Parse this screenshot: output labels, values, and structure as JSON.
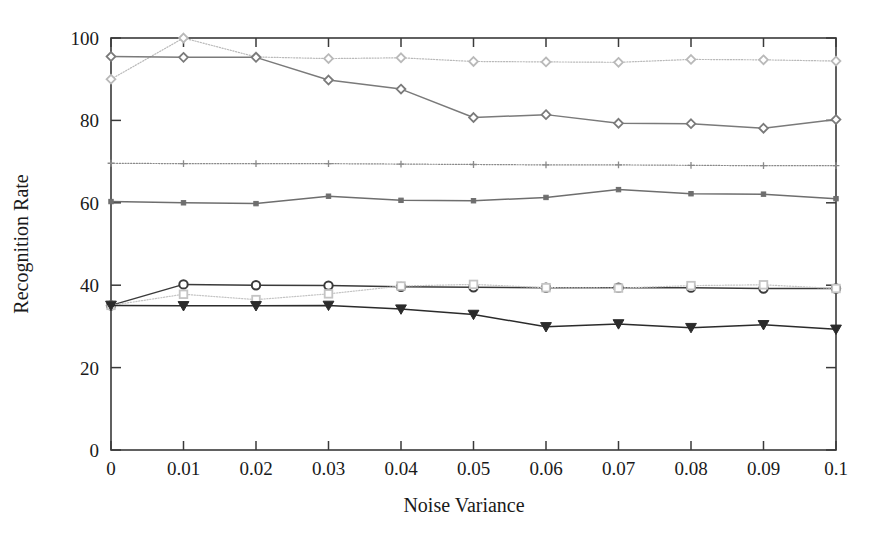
{
  "chart_data": {
    "type": "line",
    "title": "",
    "xlabel": "Noise Variance",
    "ylabel": "Recognition Rate",
    "x": [
      0,
      0.01,
      0.02,
      0.03,
      0.04,
      0.05,
      0.06,
      0.07,
      0.08,
      0.09,
      0.1
    ],
    "xticklabels": [
      "0",
      "0.01",
      "0.02",
      "0.03",
      "0.04",
      "0.05",
      "0.06",
      "0.07",
      "0.08",
      "0.09",
      "0.1"
    ],
    "yticklabels": [
      "0",
      "20",
      "40",
      "60",
      "80",
      "100"
    ],
    "yticks": [
      0,
      20,
      40,
      60,
      80,
      100
    ],
    "xlim": [
      0,
      0.1
    ],
    "ylim": [
      0,
      100
    ],
    "grid": false,
    "legend": "none",
    "series": [
      {
        "name": "series-1-light-top",
        "marker": "diamond",
        "linestyle": "dotted",
        "color": "#b9b9b9",
        "values": [
          90.0,
          100.0,
          95.4,
          95.0,
          95.2,
          94.3,
          94.2,
          94.1,
          94.8,
          94.7,
          94.4
        ]
      },
      {
        "name": "series-2-dark-declining",
        "marker": "diamond",
        "linestyle": "solid",
        "color": "#7a7a7a",
        "values": [
          95.5,
          95.3,
          95.3,
          89.8,
          87.6,
          80.7,
          81.4,
          79.3,
          79.2,
          78.1,
          80.2
        ]
      },
      {
        "name": "series-3-flat-69",
        "marker": "plus",
        "linestyle": "dotted",
        "color": "#8a8a8a",
        "values": [
          69.6,
          69.5,
          69.5,
          69.5,
          69.4,
          69.3,
          69.2,
          69.2,
          69.1,
          69.0,
          69.0
        ]
      },
      {
        "name": "series-4-mid-60",
        "marker": "square-small",
        "linestyle": "solid",
        "color": "#6e6e6e",
        "values": [
          60.3,
          60.0,
          59.8,
          61.6,
          60.6,
          60.5,
          61.3,
          63.2,
          62.2,
          62.1,
          61.0
        ]
      },
      {
        "name": "series-5-circle-40",
        "marker": "circle",
        "linestyle": "solid",
        "color": "#3a3a3a",
        "values": [
          35.1,
          40.2,
          40.0,
          39.9,
          39.6,
          39.5,
          39.4,
          39.4,
          39.4,
          39.2,
          39.2
        ]
      },
      {
        "name": "series-6-light-square",
        "marker": "square-open",
        "linestyle": "dotted",
        "color": "#c4c4c4",
        "values": [
          35.1,
          37.8,
          36.5,
          37.9,
          39.8,
          40.2,
          39.4,
          39.3,
          39.9,
          40.1,
          39.2
        ]
      },
      {
        "name": "series-7-triangle-down",
        "marker": "triangle-down",
        "linestyle": "solid",
        "color": "#2b2b2b",
        "values": [
          35.1,
          35.0,
          35.0,
          35.1,
          34.2,
          32.9,
          29.9,
          30.6,
          29.7,
          30.4,
          29.3
        ]
      }
    ]
  },
  "axes": {
    "y_axis_title": "Recognition Rate",
    "x_axis_title": "Noise Variance"
  }
}
